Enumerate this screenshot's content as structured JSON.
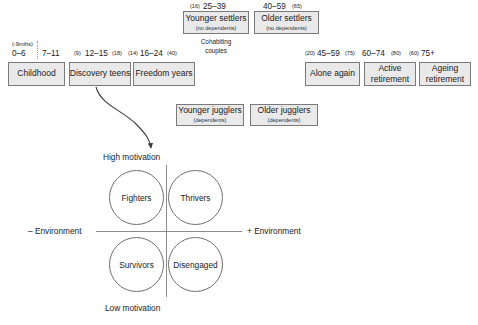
{
  "diagram": {
    "colors": {
      "box_fill": "#e9e9e9",
      "box_border": "#7a7a7a",
      "line": "#8b8b8b",
      "text": "#1a1a1a"
    }
  },
  "top_row": {
    "younger_settlers": {
      "age_label_left": "(16)",
      "age_label_range": "25–39",
      "age_label_right": "",
      "title": "Younger settlers",
      "subtitle": "(no dependents)"
    },
    "older_settlers": {
      "age_label_left": "",
      "age_label_range": "40–59",
      "age_label_right": "(65)",
      "title": "Older settlers",
      "subtitle": "(no dependents)"
    },
    "caption": "Cohabiting\ncouples"
  },
  "left_row": {
    "ages": {
      "prenatal": "(-9mths)",
      "childhood_range": "0–6",
      "childhood_second": "7–11",
      "teens_left": "(9)",
      "teens_range": "12–15",
      "teens_right": "(18)",
      "freedom_left": "(14)",
      "freedom_range": "16–24",
      "freedom_right": "(40)"
    },
    "boxes": [
      {
        "title": "Childhood",
        "subtitle": ""
      },
      {
        "title": "Discovery teens",
        "subtitle": ""
      },
      {
        "title": "Freedom years",
        "subtitle": ""
      }
    ]
  },
  "right_row": {
    "ages": {
      "alone_left": "(20)",
      "alone_range": "45–59",
      "alone_right": "(75)",
      "active_range": "60–74",
      "active_right": "(80)",
      "ageing_left": "(60)",
      "ageing_range": "75+"
    },
    "boxes": [
      {
        "title": "Alone again",
        "subtitle": ""
      },
      {
        "title": "Active\nretirement",
        "subtitle": ""
      },
      {
        "title": "Ageing\nretirement",
        "subtitle": ""
      }
    ]
  },
  "jugglers_row": {
    "younger_jugglers": {
      "title": "Younger jugglers",
      "subtitle": "(dependents)"
    },
    "older_jugglers": {
      "title": "Older jugglers",
      "subtitle": "(dependents)"
    }
  },
  "quadrant": {
    "axis_top_label": "High motivation",
    "axis_bottom_label": "Low motivation",
    "axis_left_label": "– Environment",
    "axis_right_label": "+ Environment",
    "circles": [
      {
        "label": "Fighters",
        "quadrant": "top-left"
      },
      {
        "label": "Thrivers",
        "quadrant": "top-right"
      },
      {
        "label": "Survivors",
        "quadrant": "bottom-left"
      },
      {
        "label": "Disengaged",
        "quadrant": "bottom-right"
      }
    ]
  }
}
